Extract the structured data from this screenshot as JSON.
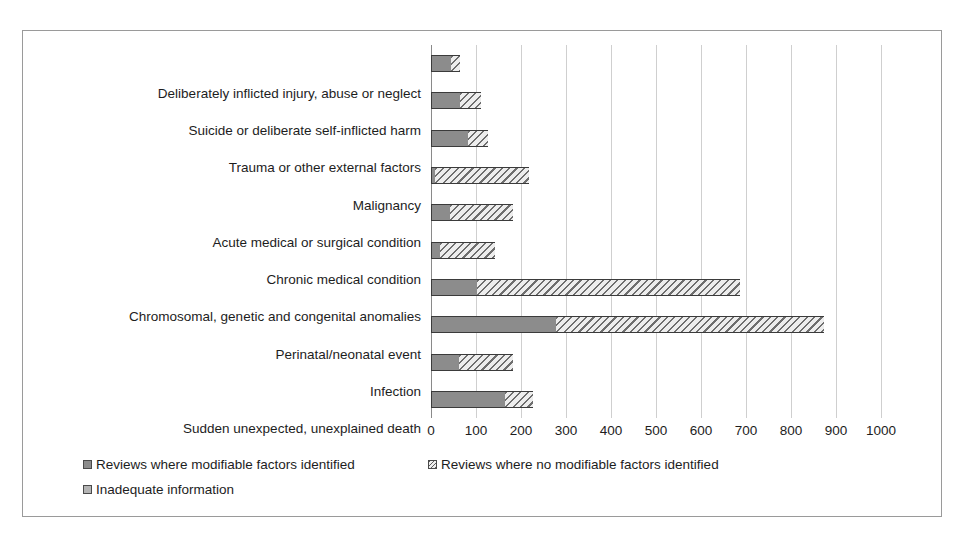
{
  "chart_data": {
    "type": "bar",
    "orientation": "horizontal",
    "stacked": true,
    "title": "",
    "subtitle": "",
    "xlabel": "",
    "ylabel": "",
    "xlim": [
      0,
      1000
    ],
    "xticks": [
      "0",
      "100",
      "200",
      "300",
      "400",
      "500",
      "600",
      "700",
      "800",
      "900",
      "1000"
    ],
    "xtick_values": [
      0,
      100,
      200,
      300,
      400,
      500,
      600,
      700,
      800,
      900,
      1000
    ],
    "grid": true,
    "legend_position": "bottom-left",
    "categories": [
      "Deliberately inflicted injury, abuse or neglect",
      "Suicide or deliberate self-inflicted harm",
      "Trauma or other external factors",
      "Malignancy",
      "Acute medical or surgical condition",
      "Chronic medical condition",
      "Chromosomal, genetic and congenital anomalies",
      "Perinatal/neonatal event",
      "Infection",
      "Sudden unexpected, unexplained death"
    ],
    "series": [
      {
        "name": "Reviews where modifiable factors identified",
        "color": "#8c8c8c",
        "values": [
          45,
          65,
          82,
          8,
          43,
          20,
          103,
          278,
          62,
          165
        ]
      },
      {
        "name": "Reviews where no modifiable factors identified",
        "color": "#e2e2e2",
        "pattern": "diagonal-hatch",
        "values": [
          20,
          45,
          45,
          210,
          139,
          122,
          583,
          595,
          120,
          62
        ]
      },
      {
        "name": "Inadequate information",
        "color": "#b4b4b4",
        "values": [
          0,
          0,
          0,
          0,
          0,
          0,
          0,
          0,
          0,
          0
        ]
      }
    ],
    "totals": [
      65,
      110,
      127,
      218,
      182,
      142,
      686,
      873,
      182,
      227
    ]
  },
  "legend": {
    "entries": [
      "Reviews where modifiable factors identified",
      "Reviews where no modifiable factors identified",
      "Inadequate information"
    ]
  }
}
